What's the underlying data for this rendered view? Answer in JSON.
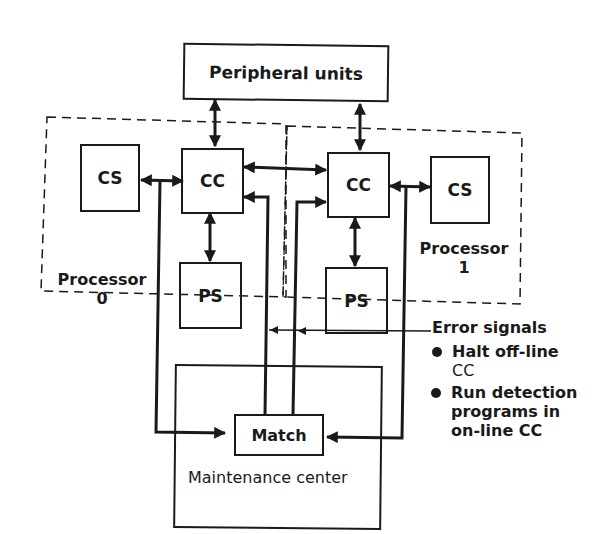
{
  "diagram": {
    "peripheral": {
      "label": "Peripheral units"
    },
    "processors": [
      {
        "name_line1": "Processor",
        "name_line2": "0",
        "cs": "CS",
        "cc": "CC",
        "ps": "PS"
      },
      {
        "name_line1": "Processor",
        "name_line2": "1",
        "cs": "CS",
        "cc": "CC",
        "ps": "PS"
      }
    ],
    "maintenance": {
      "label": "Maintenance center",
      "match": "Match"
    },
    "error_signals": {
      "title": "Error signals",
      "bullets": [
        {
          "line1": "Halt off-line",
          "line2": "CC"
        },
        {
          "line1": "Run detection",
          "line2": "programs in",
          "line3": "on-line CC"
        }
      ]
    },
    "colors": {
      "ink": "#1a1a1a",
      "background": "#ffffff"
    }
  }
}
